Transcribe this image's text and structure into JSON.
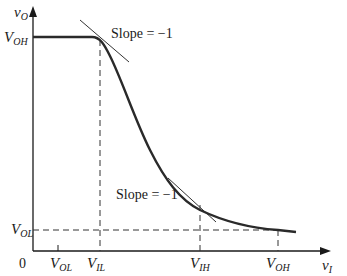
{
  "diagram": {
    "axes": {
      "y_label_main": "v",
      "y_label_sub": "O",
      "x_label_main": "v",
      "x_label_sub": "I",
      "origin": "0"
    },
    "y_ticks": [
      {
        "main": "V",
        "sub": "OH"
      },
      {
        "main": "V",
        "sub": "OL"
      }
    ],
    "x_ticks": [
      {
        "main": "V",
        "sub": "OL"
      },
      {
        "main": "V",
        "sub": "IL"
      },
      {
        "main": "V",
        "sub": "IH"
      },
      {
        "main": "V",
        "sub": "OH"
      }
    ],
    "annotations": [
      {
        "text": "Slope = −1"
      },
      {
        "text": "Slope = −1"
      }
    ],
    "colors": {
      "curve": "#2a2a2a",
      "axis": "#1a1a1a",
      "dashed": "#333333"
    }
  }
}
